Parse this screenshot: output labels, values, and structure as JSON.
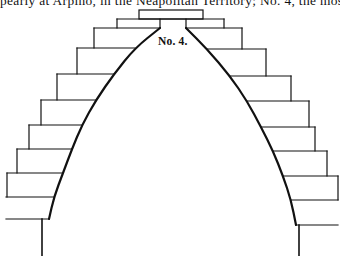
{
  "page": {
    "text_line": "pearly at Arpino, in the Neapolitan Territory; No. 4, the most commo"
  },
  "figure": {
    "label": "No. 4.",
    "stroke_color": "#111111",
    "background_color": "#ffffff",
    "top_block": {
      "x1": 139,
      "y1": 10,
      "x2": 203,
      "y2": 19
    },
    "keystone": {
      "x1": 160,
      "y1": 19,
      "x2": 186,
      "y2": 28
    },
    "second_row": {
      "x1": 117,
      "y1": 19,
      "x2": 224,
      "y2": 28
    },
    "left_steps": [
      {
        "top": 28,
        "bottom": 48,
        "outer_x": 94
      },
      {
        "top": 48,
        "bottom": 74,
        "outer_x": 77
      },
      {
        "top": 74,
        "bottom": 100,
        "outer_x": 57
      },
      {
        "top": 100,
        "bottom": 125,
        "outer_x": 41
      },
      {
        "top": 125,
        "bottom": 149,
        "outer_x": 29
      },
      {
        "top": 149,
        "bottom": 173,
        "outer_x": 17
      },
      {
        "top": 173,
        "bottom": 197,
        "outer_x": 7
      }
    ],
    "right_steps": [
      {
        "top": 28,
        "bottom": 49,
        "outer_x": 242
      },
      {
        "top": 49,
        "bottom": 76,
        "outer_x": 266
      },
      {
        "top": 76,
        "bottom": 101,
        "outer_x": 291
      },
      {
        "top": 101,
        "bottom": 127,
        "outer_x": 309
      },
      {
        "top": 127,
        "bottom": 151,
        "outer_x": 315
      },
      {
        "top": 151,
        "bottom": 176,
        "outer_x": 327
      },
      {
        "top": 176,
        "bottom": 200,
        "outer_x": 338
      }
    ],
    "left_curve": [
      [
        160,
        28
      ],
      [
        135,
        48
      ],
      [
        114,
        74
      ],
      [
        96,
        100
      ],
      [
        82,
        125
      ],
      [
        72,
        149
      ],
      [
        63,
        173
      ],
      [
        54,
        197
      ],
      [
        49,
        219
      ]
    ],
    "right_curve": [
      [
        186,
        28
      ],
      [
        207,
        49
      ],
      [
        230,
        76
      ],
      [
        247,
        101
      ],
      [
        261,
        127
      ],
      [
        273,
        151
      ],
      [
        283,
        176
      ],
      [
        291,
        200
      ],
      [
        296,
        225
      ]
    ],
    "left_base": {
      "ledge_y": 219,
      "ledge_x1": 6,
      "ledge_x2": 49,
      "wall_x": 42,
      "wall_bottom": 256
    },
    "right_base": {
      "ledge_y": 225,
      "ledge_x1": 296,
      "ledge_x2": 338,
      "wall_x": 299,
      "wall_bottom": 256
    }
  }
}
